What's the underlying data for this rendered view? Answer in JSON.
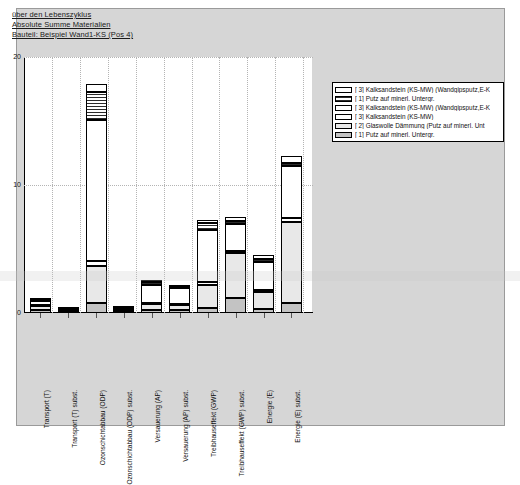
{
  "titles": {
    "line1": "über den Lebenszyklus",
    "line2": "Absolute Summe Materialien",
    "line3": "Bauteil: Beispiel Wand1-KS (Pos 4)"
  },
  "legend": {
    "items": [
      {
        "label": "[ 3] Kalksandstein (KS-MW) (Wandgipsputz,E-K",
        "swatch": "white"
      },
      {
        "label": "[ 1] Putz auf minerl. Untergr.",
        "swatch": "hatch"
      },
      {
        "label": "[ 3] Kalksandstein (KS-MW) (Wandgipsputz,E-K",
        "swatch": "white"
      },
      {
        "label": "[ 3] Kalksandstein (KS-MW)",
        "swatch": "white"
      },
      {
        "label": "[ 2] Glaswolle Dämmung (Putz auf minerl. Unt",
        "swatch": "lgray"
      },
      {
        "label": "[ 1] Putz auf minerl. Untergr.",
        "swatch": "mgray"
      }
    ]
  },
  "chart_data": {
    "type": "bar",
    "xlabel": "",
    "ylabel": "",
    "ylim": [
      0,
      20
    ],
    "yticks": [
      0,
      10,
      20
    ],
    "ytick_labels": [
      "0",
      "10",
      "20"
    ],
    "grid": true,
    "legend_position": "right-outside",
    "stacked": true,
    "categories": [
      "Transport (T)",
      "Transport (T) subst.",
      "Ozonschichtabbau (ODP)",
      "Ozonschichtabbau (ODP) subst.",
      "Versauerung (AP)",
      "Versauerung (AP) subst.",
      "Treibhauseffekt (GWP)",
      "Treibhauseffekt (GWP) subst.",
      "Energie (E)",
      "Energie (E) subst."
    ],
    "totals": [
      1.2,
      0.35,
      17.9,
      0.45,
      2.6,
      2.2,
      7.3,
      7.5,
      4.5,
      12.3
    ],
    "series": [
      {
        "name": "[ 3] Kalksandstein (KS-MW) (Wandgipsputz,E-K",
        "swatch": "white",
        "values": [
          0.15,
          0.05,
          0.6,
          0.05,
          0.2,
          0.15,
          0.3,
          0.35,
          0.3,
          0.55
        ]
      },
      {
        "name": "[ 1] Putz auf minerl. Untergr.",
        "swatch": "hatch",
        "values": [
          0.1,
          0.03,
          2.2,
          0.04,
          0.25,
          0.12,
          0.55,
          0.22,
          0.18,
          0.25
        ]
      },
      {
        "name": "[ 3] Kalksandstein (KS-MW) (Wandgipsputz,E-K",
        "swatch": "white",
        "values": [
          0.3,
          0.1,
          11.0,
          0.1,
          1.35,
          1.2,
          4.0,
          2.1,
          2.2,
          4.1
        ]
      },
      {
        "name": "[ 3] Kalksandstein (KS-MW)",
        "swatch": "white",
        "values": [
          0.1,
          0.04,
          0.45,
          0.04,
          0.1,
          0.08,
          0.25,
          0.18,
          0.15,
          0.3
        ]
      },
      {
        "name": "[ 2] Glaswolle Dämmung (Putz auf minerl. Unt",
        "swatch": "lgray",
        "values": [
          0.3,
          0.08,
          2.85,
          0.12,
          0.5,
          0.45,
          1.8,
          3.45,
          1.35,
          6.35
        ]
      },
      {
        "name": "[ 1] Putz auf minerl. Untergr.",
        "swatch": "mgray",
        "values": [
          0.25,
          0.05,
          0.8,
          0.1,
          0.2,
          0.2,
          0.4,
          1.2,
          0.32,
          0.75
        ]
      }
    ]
  }
}
